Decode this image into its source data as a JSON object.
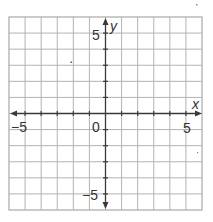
{
  "chart_data": {
    "type": "scatter",
    "title": "",
    "xlabel": "x",
    "ylabel": "y",
    "xlim": [
      -6,
      6
    ],
    "ylim": [
      -6,
      6
    ],
    "grid": true,
    "grid_step": 1,
    "x_tick_labels": [
      {
        "value": -5,
        "label": "−5"
      },
      {
        "value": 5,
        "label": "5"
      }
    ],
    "y_tick_labels": [
      {
        "value": 5,
        "label": "5"
      },
      {
        "value": -5,
        "label": "−5"
      }
    ],
    "origin_label": "0",
    "series": [],
    "colors": {
      "grid": "#b4b4b4",
      "axis": "#3a3a3a",
      "text": "#333333"
    }
  },
  "labels": {
    "x_axis": "x",
    "y_axis": "y",
    "x_neg5": "−5",
    "x_pos5": "5",
    "y_pos5": "5",
    "y_neg5": "−5",
    "origin": "0"
  }
}
